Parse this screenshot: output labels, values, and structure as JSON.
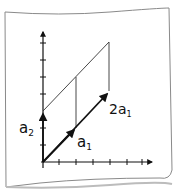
{
  "diagram": {
    "labels": {
      "a2": "a",
      "a2_sub": "2",
      "a1": "a",
      "a1_sub": "1",
      "two_a1_coef": "2a",
      "two_a1_sub": "1"
    },
    "elements": [
      "x-axis",
      "y-axis",
      "vector a2",
      "vector a1",
      "vector 2a1",
      "parallelogram guide lines"
    ],
    "colors": {
      "ink": "#111111",
      "paper": "#ffffff",
      "paper_edge": "#8a8a8a"
    }
  }
}
